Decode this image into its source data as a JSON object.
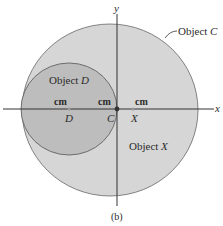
{
  "figure": {
    "caption": "(b)",
    "axes": {
      "x_label": "x",
      "y_label": "y"
    },
    "objects": {
      "C": {
        "label_prefix": "Object ",
        "label_letter": "C"
      },
      "D": {
        "label_prefix": "Object ",
        "label_letter": "D"
      },
      "X": {
        "label_prefix": "Object ",
        "label_letter": "X"
      }
    },
    "points": {
      "D": "D",
      "C": "C",
      "X": "X"
    },
    "markers": [
      "cm",
      "cm",
      "cm"
    ],
    "colors": {
      "circle_c_fill": "#d6d6d6",
      "circle_d_fill": "#bdbdbd",
      "outline": "#555555",
      "axis": "#333333"
    }
  }
}
